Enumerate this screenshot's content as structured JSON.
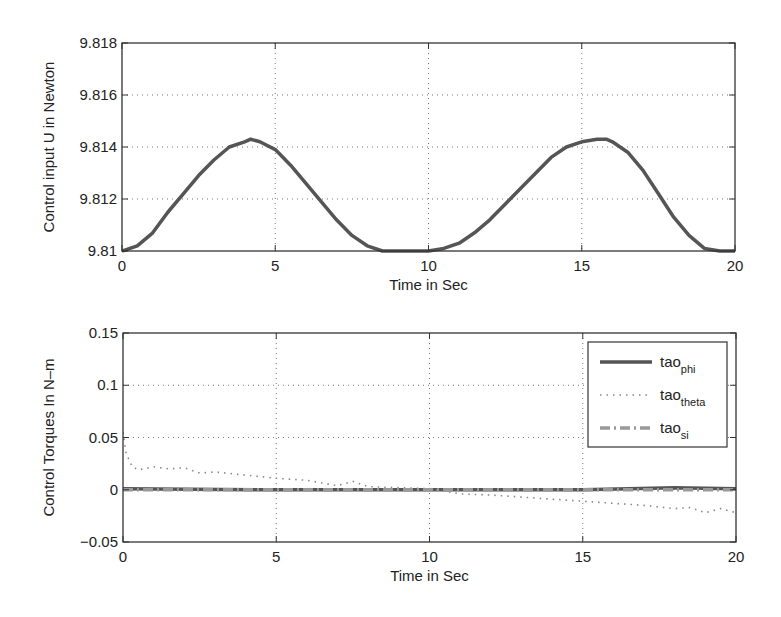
{
  "chart_data": [
    {
      "type": "line",
      "title": "",
      "xlabel": "Time in Sec",
      "ylabel": "Control input U in Newton",
      "xlim": [
        0,
        20
      ],
      "ylim": [
        9.81,
        9.818
      ],
      "xticks": [
        "0",
        "5",
        "10",
        "15",
        "20"
      ],
      "yticks": [
        "9.81",
        "9.812",
        "9.814",
        "9.816",
        "9.818"
      ],
      "grid": true,
      "legend": null,
      "series": [
        {
          "name": "U",
          "color": "#555555",
          "style": "solid",
          "x": [
            0,
            0.5,
            1,
            1.5,
            2,
            2.5,
            3,
            3.5,
            4,
            4.2,
            4.5,
            5,
            5.5,
            6,
            6.5,
            7,
            7.5,
            8,
            8.5,
            9,
            9.5,
            10,
            10.5,
            11,
            11.5,
            12,
            12.5,
            13,
            13.5,
            14,
            14.5,
            15,
            15.5,
            15.8,
            16,
            16.5,
            17,
            17.5,
            18,
            18.5,
            19,
            19.5,
            20
          ],
          "y": [
            9.81,
            9.8102,
            9.8107,
            9.8115,
            9.8122,
            9.8129,
            9.8135,
            9.814,
            9.8142,
            9.8143,
            9.8142,
            9.8139,
            9.8133,
            9.8126,
            9.8119,
            9.8112,
            9.8106,
            9.8102,
            9.81,
            9.81,
            9.81,
            9.81,
            9.8101,
            9.8103,
            9.8107,
            9.8112,
            9.8118,
            9.8124,
            9.813,
            9.8136,
            9.814,
            9.8142,
            9.8143,
            9.8143,
            9.8142,
            9.8138,
            9.8131,
            9.8122,
            9.8113,
            9.8106,
            9.8101,
            9.81,
            9.81
          ]
        }
      ]
    },
    {
      "type": "line",
      "title": "",
      "xlabel": "Time in Sec",
      "ylabel": "Control Torques In N–m",
      "xlim": [
        0,
        20
      ],
      "ylim": [
        -0.05,
        0.15
      ],
      "xticks": [
        "0",
        "5",
        "10",
        "15",
        "20"
      ],
      "yticks": [
        "−0.05",
        "0",
        "0.05",
        "0.1",
        "0.15"
      ],
      "grid": true,
      "legend_position": "upper right",
      "series": [
        {
          "name": "tao_phi",
          "legend_main": "tao",
          "legend_sub": "phi",
          "color": "#555555",
          "style": "solid",
          "x": [
            0,
            5,
            10,
            15,
            18,
            20
          ],
          "y": [
            0.001,
            0.0,
            0.0,
            0.0,
            0.002,
            0.001
          ]
        },
        {
          "name": "tao_theta",
          "legend_main": "tao",
          "legend_sub": "theta",
          "color": "#888888",
          "style": "dotted",
          "x": [
            0,
            0.1,
            0.3,
            0.5,
            1,
            1.5,
            2,
            2.5,
            3,
            4,
            5,
            6,
            7,
            7.5,
            8,
            9,
            10,
            11,
            12,
            13,
            14,
            15,
            16,
            17,
            18,
            18.5,
            19,
            19.5,
            20
          ],
          "y": [
            0.055,
            0.035,
            0.022,
            0.019,
            0.022,
            0.02,
            0.021,
            0.016,
            0.017,
            0.014,
            0.011,
            0.009,
            0.004,
            0.008,
            0.003,
            0.002,
            0.001,
            -0.004,
            -0.005,
            -0.007,
            -0.009,
            -0.011,
            -0.013,
            -0.015,
            -0.018,
            -0.017,
            -0.022,
            -0.018,
            -0.022
          ]
        },
        {
          "name": "tao_si",
          "legend_main": "tao",
          "legend_sub": "si",
          "color": "#999999",
          "style": "dashdot",
          "x": [
            0,
            5,
            10,
            15,
            20
          ],
          "y": [
            0.0,
            0.0,
            0.0,
            0.0,
            0.0
          ]
        }
      ]
    }
  ]
}
